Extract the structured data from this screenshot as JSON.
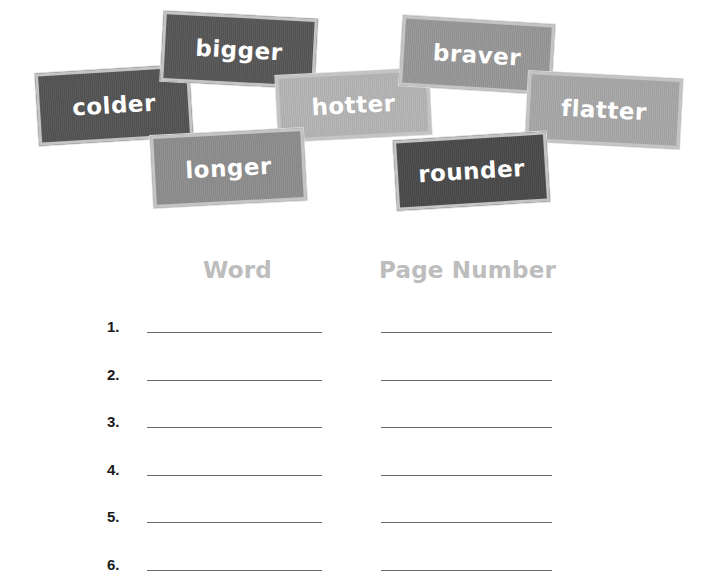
{
  "word_cards": [
    {
      "word": "colder",
      "color": "#535353",
      "left": 37,
      "top": 69,
      "width": 154,
      "height": 72,
      "rotate": -3.5
    },
    {
      "word": "bigger",
      "color": "#565656",
      "left": 162,
      "top": 15,
      "width": 154,
      "height": 70,
      "rotate": 3.0
    },
    {
      "word": "hotter",
      "color": "#b3b3b3",
      "left": 277,
      "top": 72,
      "width": 153,
      "height": 66,
      "rotate": -3.0
    },
    {
      "word": "braver",
      "color": "#969696",
      "left": 401,
      "top": 20,
      "width": 152,
      "height": 70,
      "rotate": 3.5
    },
    {
      "word": "flatter",
      "color": "#a6a6a6",
      "left": 527,
      "top": 75,
      "width": 154,
      "height": 70,
      "rotate": 3.0
    },
    {
      "word": "longer",
      "color": "#8c8c8c",
      "left": 152,
      "top": 132,
      "width": 153,
      "height": 72,
      "rotate": -3.0
    },
    {
      "word": "rounder",
      "color": "#494949",
      "left": 395,
      "top": 136,
      "width": 153,
      "height": 70,
      "rotate": -3.5
    }
  ],
  "table": {
    "headers": {
      "word": "Word",
      "page_number": "Page Number"
    },
    "rows": [
      {
        "number": "1.",
        "word": "",
        "page_number": ""
      },
      {
        "number": "2.",
        "word": "",
        "page_number": ""
      },
      {
        "number": "3.",
        "word": "",
        "page_number": ""
      },
      {
        "number": "4.",
        "word": "",
        "page_number": ""
      },
      {
        "number": "5.",
        "word": "",
        "page_number": ""
      },
      {
        "number": "6.",
        "word": "",
        "page_number": ""
      }
    ]
  },
  "colors": {
    "header_text": "#bdbdbd",
    "line": "#6a6a6a",
    "number_text": "#1a1a1a"
  }
}
